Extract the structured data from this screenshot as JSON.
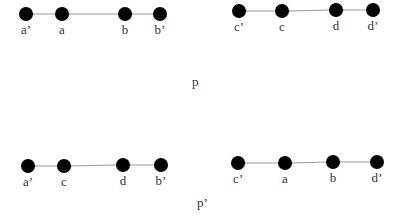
{
  "diagram": {
    "top_caption": "p",
    "bottom_caption": "p’",
    "colors": {
      "node": "#000000",
      "edge": "#999999",
      "text": "#333333"
    },
    "chains": [
      {
        "id": "top-left",
        "nodes": [
          {
            "label": "a’",
            "x": 26,
            "y": 14
          },
          {
            "label": "a",
            "x": 62,
            "y": 14
          },
          {
            "label": "b",
            "x": 125,
            "y": 14
          },
          {
            "label": "b’",
            "x": 160,
            "y": 14
          }
        ]
      },
      {
        "id": "top-right",
        "nodes": [
          {
            "label": "c’",
            "x": 239,
            "y": 11
          },
          {
            "label": "c",
            "x": 282,
            "y": 11
          },
          {
            "label": "d",
            "x": 336,
            "y": 10
          },
          {
            "label": "d’",
            "x": 373,
            "y": 10
          }
        ]
      },
      {
        "id": "bottom-left",
        "nodes": [
          {
            "label": "a’",
            "x": 28,
            "y": 166
          },
          {
            "label": "c",
            "x": 64,
            "y": 166
          },
          {
            "label": "d",
            "x": 123,
            "y": 165
          },
          {
            "label": "b’",
            "x": 161,
            "y": 165
          }
        ]
      },
      {
        "id": "bottom-right",
        "nodes": [
          {
            "label": "c’",
            "x": 238,
            "y": 163
          },
          {
            "label": "a",
            "x": 285,
            "y": 163
          },
          {
            "label": "b",
            "x": 333,
            "y": 162
          },
          {
            "label": "d’",
            "x": 377,
            "y": 162
          }
        ]
      }
    ]
  }
}
